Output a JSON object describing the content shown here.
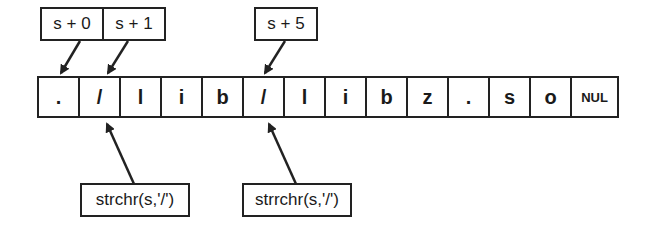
{
  "top_labels": [
    "s + 0",
    "s + 1",
    "s + 5"
  ],
  "cells": [
    ".",
    "/",
    "l",
    "i",
    "b",
    "/",
    "l",
    "i",
    "b",
    "z",
    ".",
    "s",
    "o",
    "NUL"
  ],
  "bottom_labels": [
    "strchr(s,'/')",
    "strrchr(s,'/')"
  ]
}
